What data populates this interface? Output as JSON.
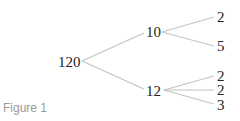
{
  "figure": {
    "caption": "Figure 1",
    "root": "120",
    "level1": [
      "10",
      "12"
    ],
    "leaves_of_10": [
      "2",
      "5"
    ],
    "leaves_of_12": [
      "2",
      "2",
      "3"
    ]
  },
  "colors": {
    "text": "#222222",
    "edges": "#c4c4c4",
    "caption": "#9a9a9a"
  }
}
